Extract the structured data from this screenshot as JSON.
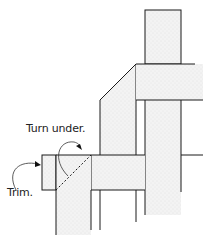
{
  "diagram": {
    "labels": {
      "turn_under": "Turn under.",
      "trim": "Trim."
    },
    "colors": {
      "stroke": "#1a1a1a",
      "fill": "#f1f1f1",
      "background": "#ffffff"
    }
  }
}
